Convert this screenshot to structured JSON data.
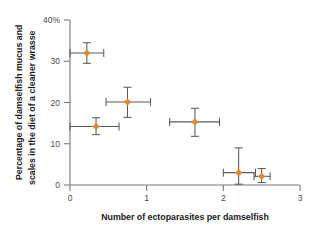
{
  "chart_data": {
    "type": "scatter",
    "title": "",
    "xlabel": "Number of ectoparasites per damselfish",
    "ylabel": "Percentage of damselfish mucus and scales in the diet of a cleaner wrasse",
    "ylabel_line1": "Percentage of damselfish mucus and",
    "ylabel_line2": "scales in the diet of a cleaner wrasse",
    "xlim": [
      0,
      3
    ],
    "ylim": [
      0,
      40
    ],
    "xticks": [
      0,
      1,
      2,
      3
    ],
    "xtick_labels": [
      "0",
      "1",
      "2",
      "3"
    ],
    "yticks": [
      0,
      10,
      20,
      30,
      40
    ],
    "ytick_labels": [
      "0",
      "10",
      "20",
      "30",
      "40%"
    ],
    "grid": false,
    "legend": null,
    "marker_color": "#E08A2E",
    "errorbar_color": "#5A5A5A",
    "axis_color": "#7A7A7A",
    "points": [
      {
        "x": 0.22,
        "y": 32.0,
        "xerr_low": 0.22,
        "xerr_high": 0.22,
        "yerr_low": 2.5,
        "yerr_high": 2.5
      },
      {
        "x": 0.75,
        "y": 20.1,
        "xerr_low": 0.28,
        "xerr_high": 0.3,
        "yerr_low": 3.7,
        "yerr_high": 3.6
      },
      {
        "x": 0.34,
        "y": 14.2,
        "xerr_low": 0.34,
        "xerr_high": 0.3,
        "yerr_low": 2.0,
        "yerr_high": 2.1
      },
      {
        "x": 1.63,
        "y": 15.3,
        "xerr_low": 0.33,
        "xerr_high": 0.32,
        "yerr_low": 3.5,
        "yerr_high": 3.3
      },
      {
        "x": 2.2,
        "y": 3.0,
        "xerr_low": 0.2,
        "xerr_high": 0.22,
        "yerr_low": 2.8,
        "yerr_high": 6.0
      },
      {
        "x": 2.5,
        "y": 2.1,
        "xerr_low": 0.1,
        "xerr_high": 0.11,
        "yerr_low": 1.5,
        "yerr_high": 1.9
      }
    ]
  }
}
